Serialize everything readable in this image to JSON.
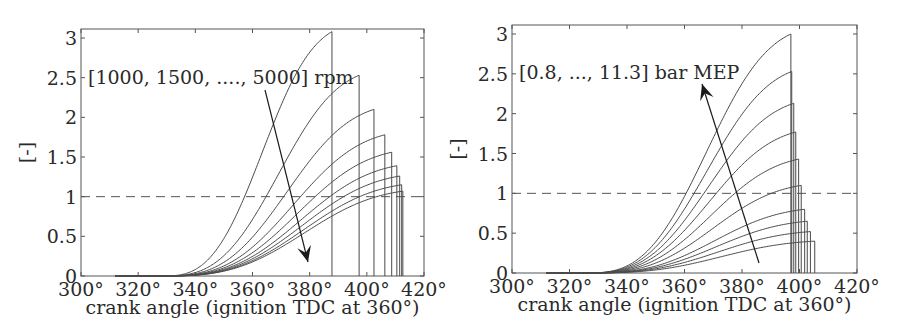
{
  "chart_data": [
    {
      "type": "line",
      "panel": "left",
      "title": "",
      "xlabel": "crank angle (ignition TDC at 360°)",
      "ylabel": "[-]",
      "xlim": [
        300,
        420
      ],
      "ylim": [
        0,
        3.1
      ],
      "xticks": [
        300,
        320,
        340,
        360,
        380,
        400,
        420
      ],
      "xtick_labels": [
        "300°",
        "320°",
        "340°",
        "360°",
        "380°",
        "400°",
        "420°"
      ],
      "yticks": [
        0,
        0.5,
        1,
        1.5,
        2,
        2.5,
        3
      ],
      "ytick_labels": [
        "0",
        "0.5",
        "1",
        "1.5",
        "2",
        "2.5",
        "3"
      ],
      "grid": false,
      "reference_line": {
        "y": 1,
        "style": "dashed"
      },
      "annotation": {
        "text": "[1000, 1500, ...., 5000] rpm",
        "arrow_direction": "down"
      },
      "curve_start_angle": 328,
      "series": [
        {
          "name": "1000 rpm",
          "end_angle": 387.8,
          "peak": 3.08
        },
        {
          "name": "1500 rpm",
          "end_angle": 397.3,
          "peak": 2.53
        },
        {
          "name": "2000 rpm",
          "end_angle": 402.5,
          "peak": 2.1
        },
        {
          "name": "2500 rpm",
          "end_angle": 406.3,
          "peak": 1.78
        },
        {
          "name": "3000 rpm",
          "end_angle": 408.7,
          "peak": 1.56
        },
        {
          "name": "3500 rpm",
          "end_angle": 410.5,
          "peak": 1.39
        },
        {
          "name": "4000 rpm",
          "end_angle": 411.5,
          "peak": 1.26
        },
        {
          "name": "4500 rpm",
          "end_angle": 412.2,
          "peak": 1.15
        },
        {
          "name": "5000 rpm",
          "end_angle": 412.6,
          "peak": 1.07
        }
      ]
    },
    {
      "type": "line",
      "panel": "right",
      "title": "",
      "xlabel": "crank angle (ignition TDC at 360°)",
      "ylabel": "[-]",
      "xlim": [
        300,
        420
      ],
      "ylim": [
        0,
        3.1
      ],
      "xticks": [
        300,
        320,
        340,
        360,
        380,
        400,
        420
      ],
      "xtick_labels": [
        "300°",
        "320°",
        "340°",
        "360°",
        "380°",
        "400°",
        "420°"
      ],
      "yticks": [
        0,
        0.5,
        1,
        1.5,
        2,
        2.5,
        3
      ],
      "ytick_labels": [
        "0",
        "0.5",
        "1",
        "1.5",
        "2",
        "2.5",
        "3"
      ],
      "grid": false,
      "reference_line": {
        "y": 1,
        "style": "dashed"
      },
      "annotation": {
        "text": "[0.8, ..., 11.3] bar MEP",
        "arrow_direction": "up"
      },
      "curve_start_angle": 325,
      "series": [
        {
          "name": "11.3 bar",
          "end_angle": 397.0,
          "peak": 3.0
        },
        {
          "name": "10.1 bar",
          "end_angle": 397.3,
          "peak": 2.53
        },
        {
          "name": "8.9 bar",
          "end_angle": 398.0,
          "peak": 2.13
        },
        {
          "name": "7.7 bar",
          "end_angle": 398.7,
          "peak": 1.77
        },
        {
          "name": "6.5 bar",
          "end_angle": 399.7,
          "peak": 1.43
        },
        {
          "name": "5.3 bar",
          "end_angle": 400.6,
          "peak": 1.1
        },
        {
          "name": "4.1 bar",
          "end_angle": 401.8,
          "peak": 0.8
        },
        {
          "name": "2.9 bar",
          "end_angle": 402.7,
          "peak": 0.65
        },
        {
          "name": "1.8 bar",
          "end_angle": 403.8,
          "peak": 0.52
        },
        {
          "name": "0.8 bar",
          "end_angle": 405.3,
          "peak": 0.4
        }
      ]
    }
  ],
  "panels": {
    "left": {
      "frame": {
        "x0": 81,
        "x1": 424,
        "y_top": 29,
        "y_bottom": 276
      },
      "annotation_pos": {
        "x": 88,
        "y": 84
      },
      "arrow": {
        "x1": 265,
        "y1": 90,
        "x2": 308,
        "y2": 262
      }
    },
    "right": {
      "frame": {
        "x0": 512,
        "x1": 857,
        "y_top": 25,
        "y_bottom": 273
      },
      "annotation_pos": {
        "x": 519,
        "y": 79
      },
      "arrow": {
        "x1": 759,
        "y1": 263,
        "x2": 702,
        "y2": 84
      }
    }
  },
  "colors": {
    "curve": "#4a4a4a",
    "axis": "#555555",
    "text": "#2a2a2a",
    "arrow": "#1a1a1a"
  }
}
